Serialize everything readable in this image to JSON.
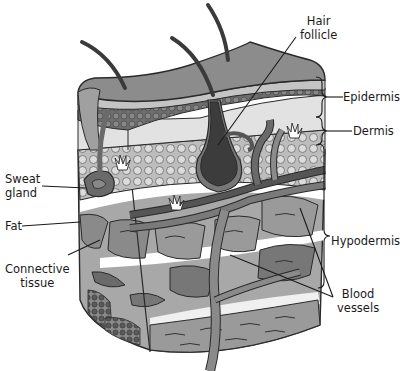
{
  "diagram": {
    "type": "anatomical-cross-section",
    "labels": {
      "hair_follicle": [
        "Hair",
        "follicle"
      ],
      "epidermis": "Epidermis",
      "dermis": "Dermis",
      "sweat_gland": [
        "Sweat",
        "gland"
      ],
      "fat": "Fat",
      "hypodermis": "Hypodermis",
      "connective_tissue": [
        "Connective",
        "tissue"
      ],
      "blood_vessels": [
        "Blood",
        "vessels"
      ]
    },
    "colors": {
      "outline": "#2a2a2a",
      "epidermis_top": "#8c8c8c",
      "epidermis_light_band": "#c4c4c4",
      "dermis_dots": "#6e6e6e",
      "dermis_bg": "#e2e2e2",
      "fat_bg": "#bdbdbd",
      "fat_cells": "#d8d8d8",
      "connective": "#8a8a8a",
      "connective_dark": "#6a6a6a",
      "muscle": "#9a9a9a",
      "follicle": "#3c3c3c",
      "vessel": "#7a7a7a",
      "vessel_dark": "#555555",
      "white": "#ffffff"
    }
  }
}
